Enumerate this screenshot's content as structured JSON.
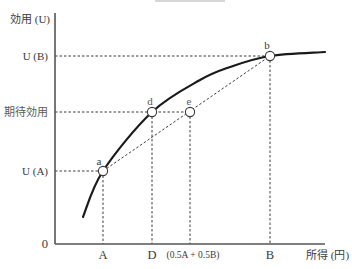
{
  "chart_data": {
    "type": "line",
    "title": "",
    "xlabel": "所得 (円)",
    "ylabel": "効用 (U)",
    "origin_label": "0",
    "xlim": [
      0,
      270
    ],
    "ylim": [
      0,
      231
    ],
    "grid": false,
    "legend": "none",
    "curve": {
      "name": "効用関数 U",
      "x": [
        28,
        48,
        97,
        145,
        175,
        215,
        270
      ],
      "y": [
        27,
        73,
        132,
        164,
        177,
        188,
        192
      ]
    },
    "points": [
      {
        "id": "a",
        "label": "a",
        "x": 48,
        "y": 73,
        "dx": -4,
        "dy": -10
      },
      {
        "id": "d",
        "label": "d",
        "x": 97,
        "y": 132,
        "dx": -2,
        "dy": -11
      },
      {
        "id": "e",
        "label": "e",
        "x": 135,
        "y": 132,
        "dx": -1,
        "dy": -11
      },
      {
        "id": "b",
        "label": "b",
        "x": 215,
        "y": 188,
        "dx": -3,
        "dy": -11
      }
    ],
    "chord": {
      "from": "a",
      "to": "b",
      "style": "dashed"
    },
    "x_ticks": [
      {
        "label": "A",
        "x": 48
      },
      {
        "label": "D",
        "x": 97
      },
      {
        "label": "(0.5A + 0.5B)",
        "x": 138
      },
      {
        "label": "B",
        "x": 215
      }
    ],
    "y_ticks": [
      {
        "label": "U (A)",
        "y": 73
      },
      {
        "label": "期待効用",
        "y": 132
      },
      {
        "label": "U (B)",
        "y": 188
      }
    ],
    "guides": {
      "horizontal_to": [
        "a",
        "e",
        "b"
      ],
      "vertical_from": [
        "a",
        "d",
        "e",
        "b"
      ]
    },
    "annotations": [
      "a",
      "b",
      "d",
      "e"
    ]
  },
  "colors": {
    "curve": "#1a1a1a",
    "axis": "#555555",
    "guide": "#3c3c3c",
    "text": "#3a3a3a"
  }
}
